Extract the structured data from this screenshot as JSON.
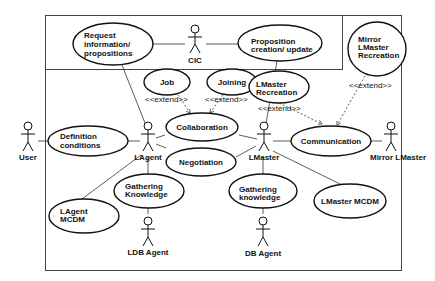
{
  "diagram": {
    "type": "uml-use-case",
    "actors": {
      "user": "User",
      "cic": "CIC",
      "lagent": "LAgent",
      "lmaster": "LMaster",
      "mirror_lmaster": "Mirror LMaster",
      "ldb_agent": "LDB Agent",
      "db_agent": "DB Agent"
    },
    "use_cases": {
      "request_info": [
        "Request",
        "information/",
        "propositions"
      ],
      "proposition": [
        "Proposition",
        "creation/ update"
      ],
      "mirror_recreation": [
        "Mirror",
        "LMaster",
        "Recreation"
      ],
      "job": "Job",
      "joining": "Joining",
      "lmaster_recreation": [
        "LMaster",
        "Recreation"
      ],
      "collaboration": "Collaboration",
      "communication": "Communication",
      "negotiation": "Negotiation",
      "definition_conditions": [
        "Definition",
        "conditions"
      ],
      "gathering_knowledge_left": [
        "Gathering",
        "Knowledge"
      ],
      "lagent_mcdm": [
        "LAgent",
        "MCDM"
      ],
      "gathering_knowledge_right": [
        "Gathering",
        "knowledge"
      ],
      "lmaster_mcdm": "LMaster MCDM"
    },
    "stereotypes": {
      "extend_job": "<<extend>>",
      "extend_joining": "<<extend>>",
      "extend_lmaster_recreation": "<<extend>>",
      "extend_mirror": "<<extend>>"
    }
  }
}
